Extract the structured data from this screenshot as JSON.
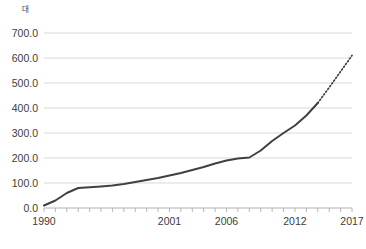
{
  "chart_data": {
    "type": "line",
    "title": "",
    "xlabel": "",
    "ylabel": "대",
    "unit_label": "대",
    "xlim": [
      1990,
      2017
    ],
    "ylim": [
      0,
      700
    ],
    "grid": true,
    "legend": false,
    "y_ticks": [
      "0.0",
      "100.0",
      "200.0",
      "300.0",
      "400.0",
      "500.0",
      "600.0",
      "700.0"
    ],
    "y_tick_values": [
      0,
      100,
      200,
      300,
      400,
      500,
      600,
      700
    ],
    "x_tick_labels": [
      "1990",
      "2001",
      "2006",
      "2012",
      "2017"
    ],
    "x_tick_values": [
      1990,
      2001,
      2006,
      2012,
      2017
    ],
    "x_all_years": [
      1990,
      1991,
      1992,
      1993,
      1994,
      1995,
      1996,
      1997,
      1998,
      1999,
      2000,
      2001,
      2002,
      2003,
      2004,
      2005,
      2006,
      2007,
      2008,
      2009,
      2010,
      2011,
      2012,
      2013,
      2014,
      2015,
      2016,
      2017
    ],
    "series": [
      {
        "name": "actual",
        "style": "solid",
        "color": "#404040",
        "x": [
          1990,
          1991,
          1992,
          1993,
          1994,
          1995,
          1996,
          1997,
          1998,
          1999,
          2000,
          2001,
          2002,
          2003,
          2004,
          2005,
          2006,
          2007,
          2008,
          2009,
          2010,
          2011,
          2012,
          2013,
          2014
        ],
        "values": [
          10,
          30,
          60,
          80,
          83,
          86,
          90,
          96,
          104,
          112,
          120,
          130,
          140,
          152,
          164,
          178,
          190,
          198,
          202,
          230,
          268,
          300,
          330,
          370,
          420
        ]
      },
      {
        "name": "projection",
        "style": "dotted",
        "color": "#404040",
        "x": [
          2014,
          2015,
          2016,
          2017
        ],
        "values": [
          420,
          482,
          546,
          610
        ]
      }
    ]
  },
  "axis": {
    "grid_color": "#d9d9d9",
    "axis_color": "#b0b0b0",
    "tick_color": "#b8b8b8",
    "text_color": "#3c3c3c"
  }
}
